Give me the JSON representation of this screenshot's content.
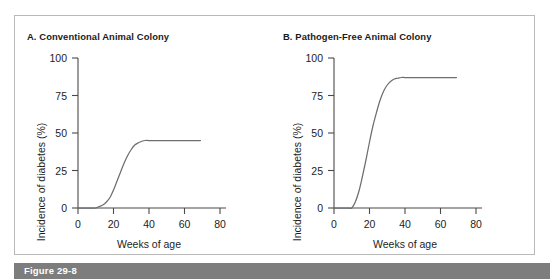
{
  "figure": {
    "caption": "Figure 29-8",
    "caption_bar_color": "#7d7d7d",
    "frame_border_color": "#b9b9b9",
    "background_color": "#ffffff"
  },
  "panels": [
    {
      "id": "A",
      "title": "A.  Conventional Animal Colony",
      "xlabel": "Weeks of age",
      "ylabel": "Incidence of diabetes (%)",
      "xticks": [
        "0",
        "20",
        "40",
        "60",
        "80"
      ],
      "yticks": [
        "0",
        "25",
        "50",
        "75",
        "100"
      ]
    },
    {
      "id": "B",
      "title": "B.  Pathogen-Free Animal Colony",
      "xlabel": "Weeks of age",
      "ylabel": "Incidence of diabetes (%)",
      "xticks": [
        "0",
        "20",
        "40",
        "60",
        "80"
      ],
      "yticks": [
        "0",
        "25",
        "50",
        "75",
        "100"
      ]
    }
  ],
  "chart_data": [
    {
      "type": "line",
      "title": "A.  Conventional Animal Colony",
      "xlabel": "Weeks of age",
      "ylabel": "Incidence of diabetes (%)",
      "xlim": [
        0,
        85
      ],
      "ylim": [
        0,
        100
      ],
      "xticks": [
        0,
        20,
        40,
        60,
        80
      ],
      "yticks": [
        0,
        25,
        50,
        75,
        100
      ],
      "grid": false,
      "legend": "none",
      "line_color": "#6e6e6e",
      "series": [
        {
          "name": "Conventional colony incidence",
          "x": [
            0,
            2,
            4,
            6,
            8,
            10,
            12,
            14,
            16,
            18,
            20,
            22,
            24,
            26,
            28,
            30,
            32,
            34,
            36,
            38,
            40,
            45,
            50,
            55,
            60,
            65,
            69
          ],
          "y": [
            0,
            0,
            0,
            0,
            0,
            0,
            1,
            2,
            4,
            7,
            12,
            18,
            24,
            30,
            35,
            39,
            42,
            43.5,
            44.5,
            45,
            45,
            45,
            45,
            45,
            45,
            45,
            45
          ]
        }
      ]
    },
    {
      "type": "line",
      "title": "B.  Pathogen-Free Animal Colony",
      "xlabel": "Weeks of age",
      "ylabel": "Incidence of diabetes (%)",
      "xlim": [
        0,
        85
      ],
      "ylim": [
        0,
        100
      ],
      "xticks": [
        0,
        20,
        40,
        60,
        80
      ],
      "yticks": [
        0,
        25,
        50,
        75,
        100
      ],
      "grid": false,
      "legend": "none",
      "line_color": "#6e6e6e",
      "series": [
        {
          "name": "Pathogen-free colony incidence",
          "x": [
            0,
            2,
            4,
            6,
            8,
            10,
            12,
            14,
            16,
            18,
            20,
            22,
            24,
            26,
            28,
            30,
            32,
            34,
            36,
            38,
            40,
            45,
            50,
            55,
            60,
            65,
            69
          ],
          "y": [
            0,
            0,
            0,
            0,
            0,
            0,
            4,
            11,
            21,
            32,
            44,
            55,
            64,
            72,
            78,
            82,
            84.5,
            86,
            86.5,
            87,
            87,
            87,
            87,
            87,
            87,
            87,
            87
          ]
        }
      ]
    }
  ]
}
